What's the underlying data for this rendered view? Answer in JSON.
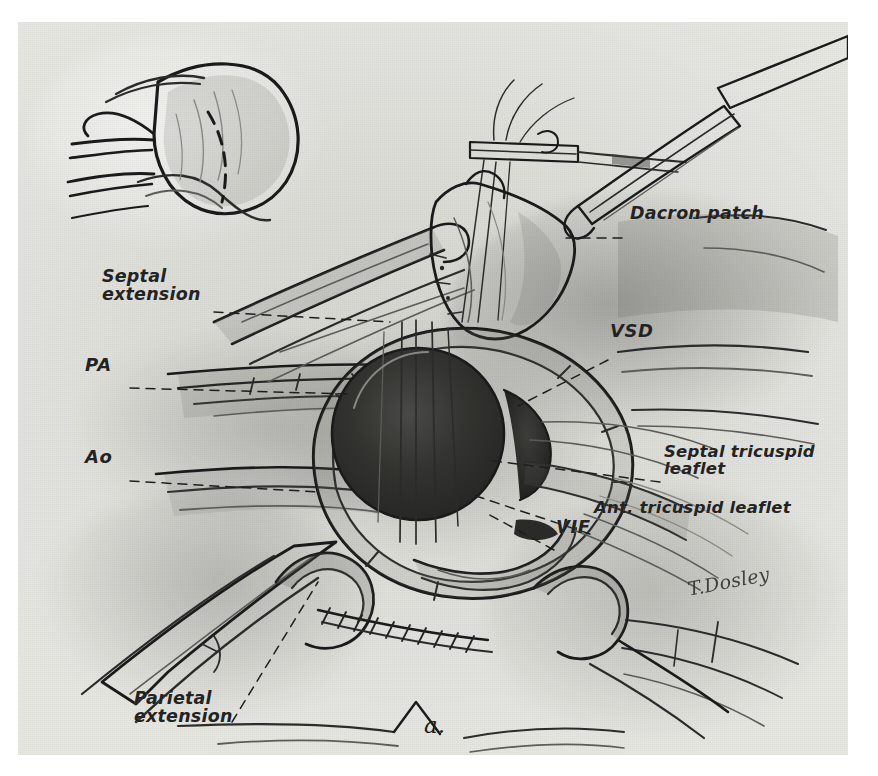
{
  "figure": {
    "type": "surgical-illustration",
    "medium": "pencil drawing (halftone scan)",
    "figure_label": "a.",
    "artist_signature": "T.Dosley",
    "background_color": "#e0e0db",
    "ink_color": "#2c2c2c",
    "plate": {
      "x": 18,
      "y": 22,
      "width": 830,
      "height": 733
    }
  },
  "labels": [
    {
      "id": "septal-extension",
      "text": "Septal\nextension",
      "x": 84,
      "y": 248,
      "leader": "dashed",
      "leader_from": [
        196,
        290
      ],
      "leader_to": [
        372,
        300
      ]
    },
    {
      "id": "dacron-patch",
      "text": "Dacron patch",
      "x": 612,
      "y": 207,
      "leader": "dashed",
      "leader_from": [
        604,
        216
      ],
      "leader_to": [
        548,
        216
      ]
    },
    {
      "id": "pa",
      "text": "PA",
      "x": 73,
      "y": 357,
      "leader": "dashed",
      "leader_from": [
        112,
        366
      ],
      "leader_to": [
        330,
        372
      ]
    },
    {
      "id": "ao",
      "text": "Ao",
      "x": 73,
      "y": 450,
      "leader": "dashed",
      "leader_from": [
        112,
        459
      ],
      "leader_to": [
        300,
        470
      ]
    },
    {
      "id": "vsd",
      "text": "VSD",
      "x": 594,
      "y": 325,
      "leader": "dashed",
      "leader_from": [
        590,
        338
      ],
      "leader_to": [
        500,
        384
      ]
    },
    {
      "id": "septal-tricuspid-leaflet",
      "text": "Septal tricuspid\nleaflet",
      "x": 648,
      "y": 450,
      "leader": "dashed",
      "leader_from": [
        642,
        460
      ],
      "leader_to": [
        468,
        438
      ]
    },
    {
      "id": "ant-tricuspid-leaflet",
      "text": "Ant. tricuspid leaflet",
      "x": 578,
      "y": 504,
      "leader": "dashed",
      "leader_from": [
        572,
        512
      ],
      "leader_to": [
        452,
        472
      ]
    },
    {
      "id": "vif",
      "text": "VIF",
      "x": 540,
      "y": 520,
      "leader": "dashed",
      "leader_from": [
        536,
        528
      ],
      "leader_to": [
        470,
        492
      ]
    },
    {
      "id": "parietal-extension",
      "text": "Parietal\nextension",
      "x": 118,
      "y": 697,
      "leader": "dashed",
      "leader_from": [
        214,
        700
      ],
      "leader_to": [
        300,
        560
      ]
    }
  ],
  "inset": {
    "id": "heart-exterior-inset",
    "description": "Small orientation drawing of the heart exterior with dashed incision line",
    "x": 55,
    "y": 45,
    "width": 260,
    "height": 180
  },
  "anatomy": [
    {
      "id": "vsd-orifice",
      "description": "Large dark ventricular septal defect orifice with suture strands"
    },
    {
      "id": "dacron-patch",
      "description": "Pale quadrilateral prosthetic patch held by forceps"
    },
    {
      "id": "great-vessels",
      "description": "Pulmonary artery and aorta trunks crossing the field at left"
    },
    {
      "id": "running-suture",
      "description": "Running suture line along the lower margin"
    },
    {
      "id": "forceps",
      "description": "Two surgical forceps / needle holders at top of field"
    }
  ]
}
